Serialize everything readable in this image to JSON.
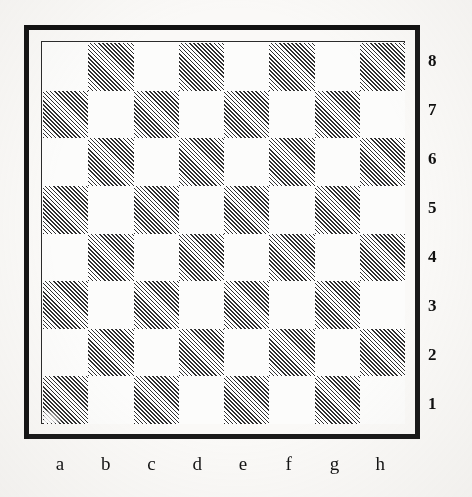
{
  "diagram": {
    "kind": "chessboard-diagram",
    "orientation": "white-at-bottom",
    "board_size": 8,
    "colors": {
      "page_background": "#faf9f7",
      "light_square": "#fcfcfb",
      "dark_square_hatch": "#2d2d2d",
      "frame": "#1a1a1a",
      "inner_rule": "#2b2b2b",
      "label_text": "#111111"
    },
    "dark_square_style": "diagonal-hatching"
  },
  "coordinates": {
    "files": [
      "a",
      "b",
      "c",
      "d",
      "e",
      "f",
      "g",
      "h"
    ],
    "ranks": [
      "8",
      "7",
      "6",
      "5",
      "4",
      "3",
      "2",
      "1"
    ],
    "ranks_position": "right",
    "files_position": "bottom"
  },
  "chart_data": {
    "type": "heatmap",
    "title": "",
    "xlabel": "",
    "ylabel": "",
    "categories": [
      "a",
      "b",
      "c",
      "d",
      "e",
      "f",
      "g",
      "h"
    ],
    "rows": [
      "8",
      "7",
      "6",
      "5",
      "4",
      "3",
      "2",
      "1"
    ],
    "legend": [
      "light square",
      "dark square"
    ],
    "grid": true,
    "note": "Standard empty chessboard. 1 = dark (hatched) square, 0 = light square. Row order top-to-bottom is rank 8 down to rank 1; column order left-to-right is file a to h. Light square h1 and a8 confirm standard colouring.",
    "values": [
      [
        0,
        1,
        0,
        1,
        0,
        1,
        0,
        1
      ],
      [
        1,
        0,
        1,
        0,
        1,
        0,
        1,
        0
      ],
      [
        0,
        1,
        0,
        1,
        0,
        1,
        0,
        1
      ],
      [
        1,
        0,
        1,
        0,
        1,
        0,
        1,
        0
      ],
      [
        0,
        1,
        0,
        1,
        0,
        1,
        0,
        1
      ],
      [
        1,
        0,
        1,
        0,
        1,
        0,
        1,
        0
      ],
      [
        0,
        1,
        0,
        1,
        0,
        1,
        0,
        1
      ],
      [
        1,
        0,
        1,
        0,
        1,
        0,
        1,
        0
      ]
    ]
  }
}
